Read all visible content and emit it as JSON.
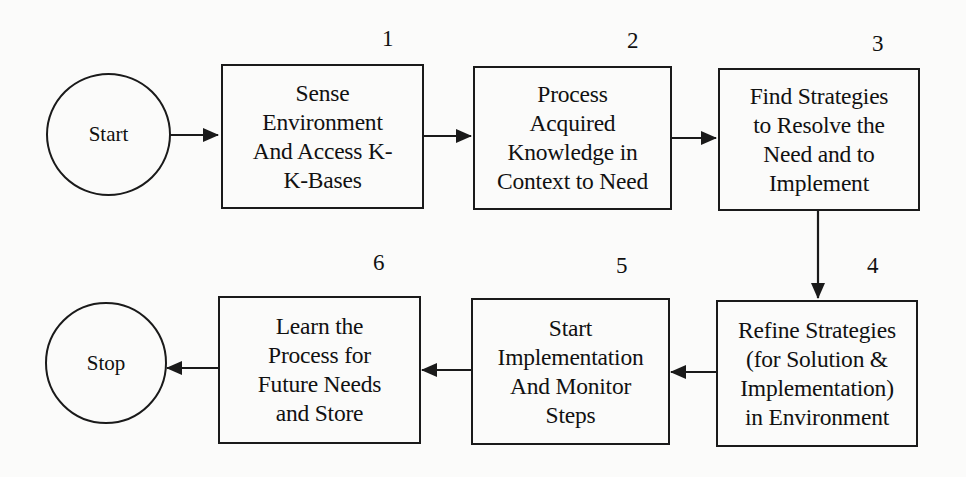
{
  "diagram": {
    "type": "flowchart",
    "terminals": {
      "start": {
        "label": "Start"
      },
      "stop": {
        "label": "Stop"
      }
    },
    "steps": [
      {
        "number": "1",
        "label": "Sense\nEnvironment\nAnd Access K-\nK-Bases"
      },
      {
        "number": "2",
        "label": "Process\nAcquired\nKnowledge in\nContext to Need"
      },
      {
        "number": "3",
        "label": "Find Strategies\nto Resolve the\nNeed and  to\nImplement"
      },
      {
        "number": "4",
        "label": "Refine Strategies\n(for Solution &\nImplementation)\nin Environment"
      },
      {
        "number": "5",
        "label": "Start\nImplementation\nAnd Monitor\nSteps"
      },
      {
        "number": "6",
        "label": "Learn the\nProcess for\nFuture Needs\nand Store"
      }
    ],
    "edges": [
      {
        "from": "Start",
        "to": "1"
      },
      {
        "from": "1",
        "to": "2"
      },
      {
        "from": "2",
        "to": "3"
      },
      {
        "from": "3",
        "to": "4"
      },
      {
        "from": "4",
        "to": "5"
      },
      {
        "from": "5",
        "to": "6"
      },
      {
        "from": "6",
        "to": "Stop"
      }
    ]
  }
}
